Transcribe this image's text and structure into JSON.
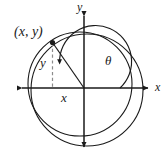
{
  "figure": {
    "type": "math-diagram",
    "background_color": "#ffffff",
    "stroke_color": "#1a1a1a",
    "dashed_color": "#8c8c8c",
    "labels": {
      "point": "(x, y)",
      "axis_x": "x",
      "axis_y": "y",
      "leg_x": "x",
      "leg_y": "y",
      "angle": "θ"
    },
    "geometry": {
      "origin": {
        "x": 84,
        "y": 88
      },
      "point_on_circle": {
        "x": 52,
        "y": 42
      },
      "inner_circle": {
        "cx": 80,
        "cy": 84,
        "r": 52
      },
      "outer_circle": {
        "cx": 87,
        "cy": 90,
        "r": 56
      },
      "angle_arc_radius": 36,
      "axis_x_span": [
        16,
        154
      ],
      "axis_y_span": [
        10,
        152
      ]
    }
  }
}
